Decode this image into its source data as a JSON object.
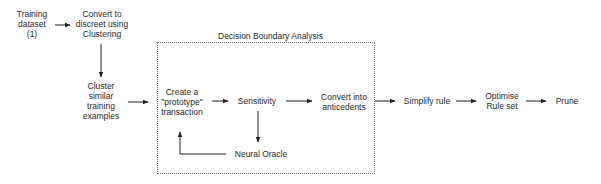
{
  "diagram": {
    "group": {
      "title": "Decision Boundary Analysis"
    },
    "nodes": [
      {
        "id": "training-dataset",
        "label": "Training\ndataset\n(1)"
      },
      {
        "id": "convert-discreet",
        "label": "Convert to\ndiscreet using\nClustering"
      },
      {
        "id": "cluster-similar",
        "label": "Cluster\nsimilar\ntraining\nexamples"
      },
      {
        "id": "create-prototype",
        "label": "Create a\n\"prototype\"\ntransaction"
      },
      {
        "id": "sensitivity",
        "label": "Sensitivity"
      },
      {
        "id": "convert-antecedents",
        "label": "Convert into\nanticedents"
      },
      {
        "id": "neural-oracle",
        "label": "Neural Oracle"
      },
      {
        "id": "simplify-rule",
        "label": "Simplify rule"
      },
      {
        "id": "optimise-rule-set",
        "label": "Optimise\nRule set"
      },
      {
        "id": "prune",
        "label": "Prune"
      }
    ],
    "edges": [
      {
        "from": "training-dataset",
        "to": "convert-discreet"
      },
      {
        "from": "convert-discreet",
        "to": "cluster-similar"
      },
      {
        "from": "cluster-similar",
        "to": "create-prototype"
      },
      {
        "from": "create-prototype",
        "to": "sensitivity"
      },
      {
        "from": "sensitivity",
        "to": "convert-antecedents"
      },
      {
        "from": "sensitivity",
        "to": "neural-oracle"
      },
      {
        "from": "neural-oracle",
        "to": "create-prototype"
      },
      {
        "from": "convert-antecedents",
        "to": "simplify-rule"
      },
      {
        "from": "simplify-rule",
        "to": "optimise-rule-set"
      },
      {
        "from": "optimise-rule-set",
        "to": "prune"
      }
    ]
  }
}
